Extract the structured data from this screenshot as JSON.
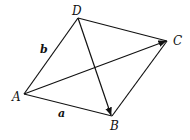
{
  "diagram": {
    "type": "parallelogram-vectors",
    "vertices": {
      "A": {
        "label": "A",
        "x": 24,
        "y": 94
      },
      "B": {
        "label": "B",
        "x": 112,
        "y": 116
      },
      "C": {
        "label": "C",
        "x": 167,
        "y": 41
      },
      "D": {
        "label": "D",
        "x": 78,
        "y": 18
      }
    },
    "vector_labels": {
      "a": {
        "label": "a",
        "side": "AB"
      },
      "b": {
        "label": "b",
        "side": "AD"
      }
    },
    "edges": [
      {
        "from": "A",
        "to": "B",
        "arrow": false
      },
      {
        "from": "B",
        "to": "C",
        "arrow": false
      },
      {
        "from": "C",
        "to": "D",
        "arrow": false
      },
      {
        "from": "D",
        "to": "A",
        "arrow": false
      },
      {
        "from": "A",
        "to": "C",
        "arrow": true
      },
      {
        "from": "D",
        "to": "B",
        "arrow": true
      }
    ],
    "colors": {
      "line": "#111111",
      "background": "#ffffff"
    }
  }
}
